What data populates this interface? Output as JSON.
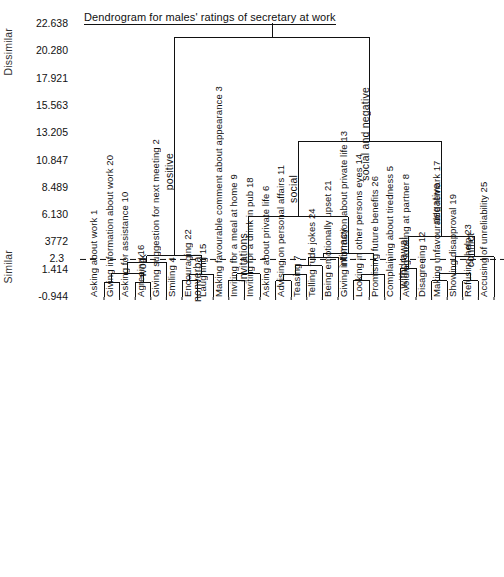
{
  "title": "Dendrogram for males' ratings of secretary at work",
  "axis": {
    "top_label": "Dissimilar",
    "bottom_label": "Similar",
    "ticks": [
      "22.638",
      "20.280",
      "17.921",
      "15.563",
      "13.205",
      "10.847",
      "8.489",
      "6.130",
      "3772",
      "2.3",
      "1.414",
      "-0.944"
    ],
    "cut_line_value": "2.3"
  },
  "chart_data": {
    "type": "dendrogram",
    "title": "Dendrogram for males' ratings of secretary at work",
    "ylabel_top": "Dissimilar",
    "ylabel_bottom": "Similar",
    "ytick_labels": [
      "22.638",
      "20.280",
      "17.921",
      "15.563",
      "13.205",
      "10.847",
      "8.489",
      "6.130",
      "3772",
      "2.3",
      "1.414",
      "-0.944"
    ],
    "ytick_values": [
      22.638,
      20.28,
      17.921,
      15.563,
      13.205,
      10.847,
      8.489,
      6.13,
      3.772,
      2.3,
      1.414,
      -0.944
    ],
    "ylim": [
      -0.944,
      22.638
    ],
    "cut_line": 2.3,
    "grid": false,
    "leaves": [
      {
        "order": 1,
        "id": "1",
        "label": "Asking about work"
      },
      {
        "order": 2,
        "id": "20",
        "label": "Giving information about work"
      },
      {
        "order": 3,
        "id": "10",
        "label": "Asking for assistance"
      },
      {
        "order": 4,
        "id": "16",
        "label": "Agreeing"
      },
      {
        "order": 5,
        "id": "2",
        "label": "Giving suggestion for next meeting"
      },
      {
        "order": 6,
        "id": "4",
        "label": "Smiling"
      },
      {
        "order": 7,
        "id": "22",
        "label": "Encouraging"
      },
      {
        "order": 8,
        "id": "15",
        "label": "Laughing"
      },
      {
        "order": 9,
        "id": "3",
        "label": "Making favourable comment about appearance"
      },
      {
        "order": 10,
        "id": "9",
        "label": "Inviting for a meal at home"
      },
      {
        "order": 11,
        "id": "18",
        "label": "Inviting for a drink in pub"
      },
      {
        "order": 12,
        "id": "6",
        "label": "Asking about private life"
      },
      {
        "order": 13,
        "id": "11",
        "label": "Advising on personal affairs"
      },
      {
        "order": 14,
        "id": "7",
        "label": "Teasing"
      },
      {
        "order": 15,
        "id": "24",
        "label": "Telling rude jokes"
      },
      {
        "order": 16,
        "id": "21",
        "label": "Being emotionally upset"
      },
      {
        "order": 17,
        "id": "13",
        "label": "Giving information about private life"
      },
      {
        "order": 18,
        "id": "14",
        "label": "Looking in other persons eyes"
      },
      {
        "order": 19,
        "id": "26",
        "label": "Promising future benefits"
      },
      {
        "order": 20,
        "id": "5",
        "label": "Complaining about tiredness"
      },
      {
        "order": 21,
        "id": "8",
        "label": "Avoiding looking at partner"
      },
      {
        "order": 22,
        "id": "12",
        "label": "Disagreeing"
      },
      {
        "order": 23,
        "id": "17",
        "label": "Making unfavourable remark"
      },
      {
        "order": 24,
        "id": "19",
        "label": "Showing disapproval"
      },
      {
        "order": 25,
        "id": "23",
        "label": "Refusing help"
      },
      {
        "order": 26,
        "id": "25",
        "label": "Accusing of unreliability"
      }
    ],
    "cluster_labels": [
      {
        "name": "work",
        "height": 2.6
      },
      {
        "name": "nonverbal",
        "height": 2.6
      },
      {
        "name": "positive",
        "height": 21.5
      },
      {
        "name": "invitations",
        "height": 6.0
      },
      {
        "name": "intimacy",
        "height": 3.1
      },
      {
        "name": "social",
        "height": 12.5
      },
      {
        "name": "withdrawal",
        "height": 4.3
      },
      {
        "name": "conflict",
        "height": 2.9
      },
      {
        "name": "negative",
        "height": 12.5
      },
      {
        "name": "social and negative",
        "height": 21.5
      }
    ],
    "merges": [
      {
        "label": "",
        "left": 1,
        "right": 2,
        "height": 0.35
      },
      {
        "label": "",
        "left": 3,
        "right": 4,
        "height": 0.35
      },
      {
        "label": "",
        "left": "m0",
        "right": "m1",
        "height": 1.1
      },
      {
        "label": "work",
        "left": "m2",
        "right": 5,
        "height": 2.05
      },
      {
        "label": "",
        "left": 6,
        "right": 7,
        "height": 0.5
      },
      {
        "label": "nonverbal",
        "left": "m4",
        "right": 8,
        "height": 1.0
      },
      {
        "label": "positive",
        "left": "m3",
        "right": "m5",
        "height": 2.6
      },
      {
        "label": "",
        "left": 9,
        "right": 10,
        "height": 0.5
      },
      {
        "label": "invitations",
        "left": "m7",
        "right": 11,
        "height": 1.05
      },
      {
        "label": "",
        "left": 12,
        "right": 13,
        "height": 0.45
      },
      {
        "label": "",
        "left": "m9",
        "right": 14,
        "height": 1.0
      },
      {
        "label": "",
        "left": "m10",
        "right": 15,
        "height": 1.75
      },
      {
        "label": "",
        "left": "m11",
        "right": 16,
        "height": 2.5
      },
      {
        "label": "",
        "left": 17,
        "right": 18,
        "height": 0.5
      },
      {
        "label": "",
        "left": "m13",
        "right": 19,
        "height": 1.0
      },
      {
        "label": "intimacy",
        "left": "m12",
        "right": "m14",
        "height": 2.85
      },
      {
        "label": "social",
        "left": "m8",
        "right": "m15",
        "height": 6.0
      },
      {
        "label": "withdrawal",
        "left": 20,
        "right": 21,
        "height": 1.55
      },
      {
        "label": "",
        "left": 22,
        "right": 23,
        "height": 0.45
      },
      {
        "label": "",
        "left": 24,
        "right": 25,
        "height": 0.45
      },
      {
        "label": "",
        "left": "m18",
        "right": "m19",
        "height": 1.1
      },
      {
        "label": "conflict",
        "left": "m20",
        "right": 26,
        "height": 2.55
      },
      {
        "label": "negative",
        "left": "m17",
        "right": "m21",
        "height": 4.3
      },
      {
        "label": "social and negative",
        "left": "m16",
        "right": "m22",
        "height": 12.5
      },
      {
        "label": "root",
        "left": "m6",
        "right": "m23",
        "height": 21.5
      }
    ]
  }
}
